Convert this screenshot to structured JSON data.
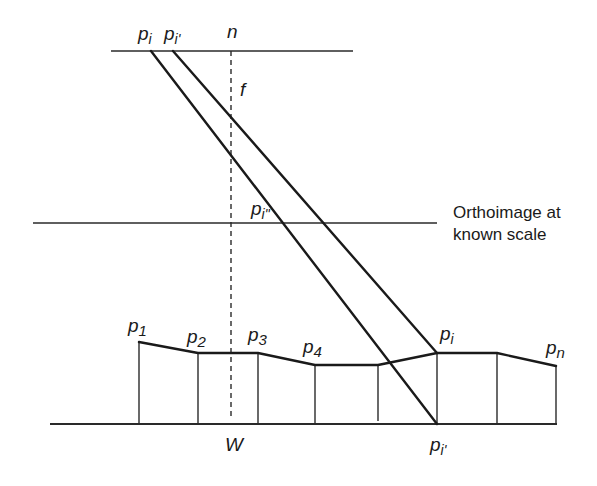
{
  "figure": {
    "labels": {
      "image_point_pi": "p",
      "image_point_pi_sub": "i",
      "image_point_pi_prime_top": "p",
      "image_point_pi_prime_top_sub": "i'",
      "nadir": "n",
      "focal_length": "f",
      "ortho_point": "p",
      "ortho_point_sub": "i\"",
      "orthoimage_caption_line1": "Orthoimage at",
      "orthoimage_caption_line2": "known scale",
      "p1": "p",
      "p1_sub": "1",
      "p2": "p",
      "p2_sub": "2",
      "p3": "p",
      "p3_sub": "3",
      "p4": "p",
      "p4_sub": "4",
      "pi_ground": "p",
      "pi_ground_sub": "i",
      "pn": "p",
      "pn_sub": "n",
      "datum": "W",
      "pi_datum": "p",
      "pi_datum_sub": "i'"
    },
    "geometry": {
      "image_plane": {
        "x1": 111,
        "x2": 353,
        "y": 51
      },
      "orthoimage_plane": {
        "x1": 33,
        "x2": 437,
        "y": 223
      },
      "datum_line": {
        "x1": 50,
        "x2": 557,
        "y": 424
      },
      "nadir_line": {
        "x": 231,
        "y1": 51,
        "y2": 418
      },
      "ray_to_datum": {
        "x1": 151,
        "y1": 51,
        "x2": 437,
        "y2": 424
      },
      "ray_to_terrain": {
        "x1": 173,
        "y1": 51,
        "x2": 437,
        "y2": 353
      },
      "terrain_profile": [
        [
          139,
          342
        ],
        [
          198,
          353
        ],
        [
          258,
          353
        ],
        [
          315,
          365
        ],
        [
          378,
          365
        ],
        [
          437,
          353
        ],
        [
          497,
          353
        ],
        [
          556,
          366
        ]
      ]
    }
  }
}
